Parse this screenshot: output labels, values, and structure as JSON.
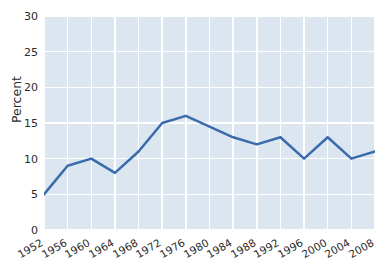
{
  "figure": {
    "title_sliver": "",
    "background_color": "#ffffff",
    "panel_color": "#dce6f0",
    "grid_color": "#ffffff",
    "line_color": "#3a6bab",
    "text_color": "#2b2b2b"
  },
  "axes": {
    "ylabel": "Percent",
    "xlabel": "",
    "yticks": [
      "0",
      "5",
      "10",
      "15",
      "20",
      "25",
      "30"
    ],
    "xticks": [
      "1952",
      "1956",
      "1960",
      "1964",
      "1968",
      "1972",
      "1976",
      "1980",
      "1984",
      "1988",
      "1992",
      "1996",
      "2000",
      "2004",
      "2008"
    ]
  },
  "chart_data": {
    "type": "line",
    "title": "",
    "xlabel": "",
    "ylabel": "Percent",
    "categories": [
      1952,
      1956,
      1960,
      1964,
      1968,
      1972,
      1976,
      1980,
      1984,
      1988,
      1992,
      1996,
      2000,
      2004,
      2008
    ],
    "values": [
      5,
      9,
      10,
      8,
      11,
      15,
      16,
      14.5,
      13,
      12,
      13,
      10,
      13,
      10,
      11
    ],
    "series": [
      {
        "name": "Percent",
        "color": "#3a6bab",
        "values": [
          5,
          9,
          10,
          8,
          11,
          15,
          16,
          14.5,
          13,
          12,
          13,
          10,
          13,
          10,
          11
        ]
      }
    ],
    "ylim": [
      0,
      30
    ],
    "xlim": [
      1952,
      2008
    ],
    "ytick_values": [
      0,
      5,
      10,
      15,
      20,
      25,
      30
    ],
    "xtick_values": [
      1952,
      1956,
      1960,
      1964,
      1968,
      1972,
      1976,
      1980,
      1984,
      1988,
      1992,
      1996,
      2000,
      2004,
      2008
    ],
    "grid": true,
    "legend": false,
    "markers": false,
    "line_width": 2.5
  }
}
